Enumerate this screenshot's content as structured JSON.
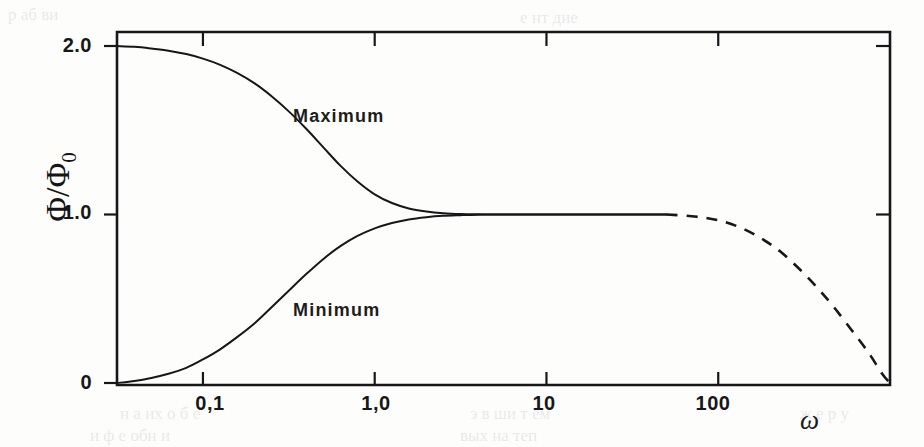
{
  "figure": {
    "background_color": "#fdfdfc",
    "ink_color": "#17171a",
    "y_axis_title_main": "Φ/Φ",
    "y_axis_title_sub": "0",
    "x_axis_title": "ω"
  },
  "chart_data": {
    "type": "line",
    "title": "",
    "subtitle": "",
    "xlabel": "ω",
    "ylabel": "Φ/Φ₀",
    "xscale": "log",
    "yscale": "linear",
    "xlim": [
      0.0316,
      1000
    ],
    "ylim": [
      0,
      2.18
    ],
    "grid": false,
    "legend_position": "inline-annotation",
    "x_tick_labels": [
      "0,1",
      "1,0",
      "10",
      "100"
    ],
    "x_tick_values": [
      0.1,
      1,
      10,
      100
    ],
    "y_tick_labels": [
      "2.0",
      "1.0",
      "0"
    ],
    "y_tick_values": [
      2.0,
      1.0,
      0
    ],
    "annotations": [
      {
        "text": "Maximum",
        "x": 0.55,
        "y": 1.62
      },
      {
        "text": "Minimum",
        "x": 0.55,
        "y": 0.38
      }
    ],
    "series": [
      {
        "name": "Maximum",
        "style": "solid",
        "color": "#17171a",
        "x": [
          0.0316,
          0.04,
          0.05,
          0.063,
          0.08,
          0.1,
          0.126,
          0.158,
          0.2,
          0.251,
          0.316,
          0.398,
          0.501,
          0.631,
          0.794,
          1.0,
          1.26,
          1.58,
          2.0,
          2.51,
          3.16,
          3.98,
          5.0,
          6.31,
          10.0,
          20.0,
          50.0
        ],
        "y": [
          2.0,
          1.995,
          1.985,
          1.972,
          1.952,
          1.925,
          1.888,
          1.84,
          1.778,
          1.702,
          1.612,
          1.51,
          1.4,
          1.29,
          1.196,
          1.12,
          1.068,
          1.036,
          1.018,
          1.008,
          1.003,
          1.001,
          1.0,
          1.0,
          1.0,
          1.0,
          1.0
        ]
      },
      {
        "name": "Minimum",
        "style": "solid",
        "color": "#17171a",
        "x": [
          0.0316,
          0.04,
          0.05,
          0.063,
          0.08,
          0.1,
          0.126,
          0.158,
          0.2,
          0.251,
          0.316,
          0.398,
          0.501,
          0.631,
          0.794,
          1.0,
          1.26,
          1.58,
          2.0,
          2.51,
          3.16,
          3.98,
          5.0,
          6.31,
          10.0,
          20.0,
          50.0
        ],
        "y": [
          0.0,
          0.012,
          0.03,
          0.055,
          0.09,
          0.14,
          0.2,
          0.272,
          0.355,
          0.45,
          0.548,
          0.645,
          0.735,
          0.812,
          0.873,
          0.918,
          0.95,
          0.971,
          0.984,
          0.992,
          0.996,
          0.999,
          1.0,
          1.0,
          1.0,
          1.0,
          1.0
        ]
      },
      {
        "name": "High-frequency roll-off (extrapolated)",
        "style": "dashed",
        "color": "#17171a",
        "x": [
          50.0,
          70.0,
          90.0,
          110.0,
          140.0,
          180.0,
          230.0,
          300.0,
          380.0,
          470.0,
          600.0,
          750.0,
          900.0,
          1000.0
        ],
        "y": [
          1.0,
          0.99,
          0.975,
          0.955,
          0.915,
          0.855,
          0.78,
          0.672,
          0.562,
          0.452,
          0.312,
          0.18,
          0.055,
          0.0
        ]
      }
    ]
  },
  "axis_frame": {
    "top_ticks": [
      0.1,
      1,
      10,
      100
    ],
    "bottom_ticks": [
      0.1,
      1,
      10,
      100
    ],
    "right_ticks": [
      2.0,
      1.0
    ],
    "left_ticks": [
      2.0,
      1.0,
      0
    ]
  },
  "scan_artifacts": [
    {
      "text": "р аб ви",
      "x": 8,
      "y": 5
    },
    {
      "text": "е нт  дие",
      "x": 520,
      "y": 8
    },
    {
      "text": "н а их о б е",
      "x": 120,
      "y": 404
    },
    {
      "text": "э в ши т ем",
      "x": 470,
      "y": 404
    },
    {
      "text": "и ф е  обн и",
      "x": 90,
      "y": 426
    },
    {
      "text": "вых на  теп",
      "x": 460,
      "y": 426
    },
    {
      "text": "ж е  р у",
      "x": 800,
      "y": 404
    }
  ]
}
